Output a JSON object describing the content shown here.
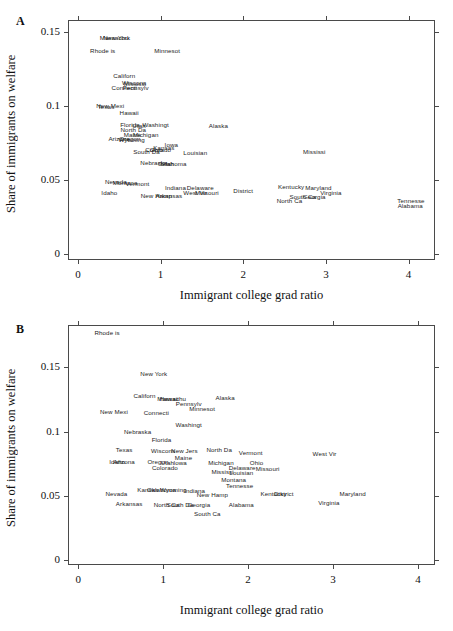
{
  "figure": {
    "axis_label_y": "Share of immigrants on welfare",
    "axis_label_x": "Immigrant college grad ratio",
    "panel_a_letter": "A",
    "panel_b_letter": "B"
  },
  "chart_data": [
    {
      "type": "scatter",
      "panel": "A",
      "title": "A",
      "xlabel": "Immigrant college grad ratio",
      "ylabel": "Share of immigrants on welfare",
      "xlim": [
        -0.12,
        4.32
      ],
      "ylim": [
        -0.004,
        0.158
      ],
      "xticks": [
        0,
        1,
        2,
        3,
        4
      ],
      "yticks": [
        0,
        0.05,
        0.1,
        0.15
      ],
      "xticklabels": [
        "0",
        "1",
        "2",
        "3",
        "4"
      ],
      "yticklabels": [
        "0",
        "0.05",
        "0.1",
        "0.15"
      ],
      "grid": false,
      "legend": "none",
      "marker": "text-label",
      "points": [
        {
          "label": "Massachu",
          "x": 0.44,
          "y": 0.1465
        },
        {
          "label": "New York",
          "x": 0.47,
          "y": 0.1465
        },
        {
          "label": "Rhode is",
          "x": 0.3,
          "y": 0.1375
        },
        {
          "label": "Minnesot",
          "x": 1.08,
          "y": 0.1375
        },
        {
          "label": "Californ",
          "x": 0.56,
          "y": 0.1212
        },
        {
          "label": "Wiscons",
          "x": 0.68,
          "y": 0.116
        },
        {
          "label": "Mississi",
          "x": 0.69,
          "y": 0.1158
        },
        {
          "label": "Connecti",
          "x": 0.56,
          "y": 0.113
        },
        {
          "label": "Pennsylv",
          "x": 0.7,
          "y": 0.1128
        },
        {
          "label": "New Mexi",
          "x": 0.39,
          "y": 0.1003
        },
        {
          "label": "Texas",
          "x": 0.34,
          "y": 0.1001
        },
        {
          "label": "Hawaii",
          "x": 0.62,
          "y": 0.096
        },
        {
          "label": "Florida",
          "x": 0.63,
          "y": 0.088
        },
        {
          "label": "Washingt",
          "x": 0.94,
          "y": 0.0878
        },
        {
          "label": "Utah",
          "x": 0.74,
          "y": 0.0872
        },
        {
          "label": "Alaska",
          "x": 1.7,
          "y": 0.0872
        },
        {
          "label": "North Da",
          "x": 0.67,
          "y": 0.0846
        },
        {
          "label": "Maine",
          "x": 0.66,
          "y": 0.0812
        },
        {
          "label": "Michigan",
          "x": 0.82,
          "y": 0.081
        },
        {
          "label": "Arizona",
          "x": 0.5,
          "y": 0.0786
        },
        {
          "label": "Oregon",
          "x": 0.63,
          "y": 0.0782
        },
        {
          "label": "Wyoming",
          "x": 0.65,
          "y": 0.078
        },
        {
          "label": "Iowa",
          "x": 1.13,
          "y": 0.074
        },
        {
          "label": "Kansas",
          "x": 1.04,
          "y": 0.0724
        },
        {
          "label": "Ohio",
          "x": 0.95,
          "y": 0.071
        },
        {
          "label": "Colorado",
          "x": 0.97,
          "y": 0.0706
        },
        {
          "label": "South Da",
          "x": 0.83,
          "y": 0.0694
        },
        {
          "label": "Louisian",
          "x": 1.42,
          "y": 0.069
        },
        {
          "label": "Mississi",
          "x": 2.86,
          "y": 0.0694
        },
        {
          "label": "Nebraska",
          "x": 0.92,
          "y": 0.062
        },
        {
          "label": "Utah",
          "x": 1.08,
          "y": 0.0618
        },
        {
          "label": "Oklahoma",
          "x": 1.14,
          "y": 0.0616
        },
        {
          "label": "Nevada",
          "x": 0.46,
          "y": 0.049
        },
        {
          "label": "Montana",
          "x": 0.57,
          "y": 0.0488
        },
        {
          "label": "Vermont",
          "x": 0.72,
          "y": 0.0478
        },
        {
          "label": "Kentucky",
          "x": 2.58,
          "y": 0.0462
        },
        {
          "label": "Maryland",
          "x": 2.91,
          "y": 0.0455
        },
        {
          "label": "Indiana",
          "x": 1.18,
          "y": 0.0452
        },
        {
          "label": "Delaware",
          "x": 1.48,
          "y": 0.0452
        },
        {
          "label": "District",
          "x": 2.0,
          "y": 0.043
        },
        {
          "label": "Virginia",
          "x": 3.06,
          "y": 0.042
        },
        {
          "label": "Idaho",
          "x": 0.38,
          "y": 0.042
        },
        {
          "label": "West Vir",
          "x": 1.42,
          "y": 0.0422
        },
        {
          "label": "Missouri",
          "x": 1.56,
          "y": 0.042
        },
        {
          "label": "New Hamp",
          "x": 0.95,
          "y": 0.04
        },
        {
          "label": "Arkansas",
          "x": 1.1,
          "y": 0.0402
        },
        {
          "label": "South Ca",
          "x": 2.72,
          "y": 0.0392
        },
        {
          "label": "Georgia",
          "x": 2.86,
          "y": 0.039
        },
        {
          "label": "North Ca",
          "x": 2.56,
          "y": 0.0368
        },
        {
          "label": "Tennesse",
          "x": 4.03,
          "y": 0.0368
        },
        {
          "label": "Alabama",
          "x": 4.02,
          "y": 0.033
        }
      ]
    },
    {
      "type": "scatter",
      "panel": "B",
      "title": "B",
      "xlabel": "Immigrant college grad ratio",
      "ylabel": "Share of immigrants on welfare",
      "xlim": [
        -0.12,
        4.2
      ],
      "ylim": [
        -0.004,
        0.183
      ],
      "xticks": [
        0,
        1,
        2,
        3,
        4
      ],
      "yticks": [
        0,
        0.05,
        0.1,
        0.15
      ],
      "xticklabels": [
        "0",
        "1",
        "2",
        "3",
        "4"
      ],
      "yticklabels": [
        "0",
        "0.05",
        "0.1",
        "0.15"
      ],
      "grid": false,
      "legend": "none",
      "marker": "text-label",
      "points": [
        {
          "label": "Rhode is",
          "x": 0.34,
          "y": 0.1775
        },
        {
          "label": "New York",
          "x": 0.89,
          "y": 0.1455
        },
        {
          "label": "Californ",
          "x": 0.78,
          "y": 0.1288
        },
        {
          "label": "Hawaii",
          "x": 1.07,
          "y": 0.1262
        },
        {
          "label": "Massachu",
          "x": 1.1,
          "y": 0.1262
        },
        {
          "label": "Alaska",
          "x": 1.73,
          "y": 0.1272
        },
        {
          "label": "Pennsylv",
          "x": 1.3,
          "y": 0.1222
        },
        {
          "label": "Minnesot",
          "x": 1.46,
          "y": 0.1182
        },
        {
          "label": "New Mexi",
          "x": 0.42,
          "y": 0.116
        },
        {
          "label": "Connecti",
          "x": 0.92,
          "y": 0.1152
        },
        {
          "label": "Washingt",
          "x": 1.3,
          "y": 0.1058
        },
        {
          "label": "Nebraska",
          "x": 0.7,
          "y": 0.1002
        },
        {
          "label": "Florida",
          "x": 0.98,
          "y": 0.0938
        },
        {
          "label": "Texas",
          "x": 0.54,
          "y": 0.086
        },
        {
          "label": "Wiscons",
          "x": 1.0,
          "y": 0.0858
        },
        {
          "label": "New Jers",
          "x": 1.25,
          "y": 0.0858
        },
        {
          "label": "North Da",
          "x": 1.66,
          "y": 0.086
        },
        {
          "label": "Vermont",
          "x": 2.03,
          "y": 0.084
        },
        {
          "label": "West Vir",
          "x": 2.9,
          "y": 0.0832
        },
        {
          "label": "Maine",
          "x": 1.24,
          "y": 0.0805
        },
        {
          "label": "Idaho",
          "x": 0.46,
          "y": 0.0772
        },
        {
          "label": "Arizona",
          "x": 0.54,
          "y": 0.0768
        },
        {
          "label": "Oregon",
          "x": 0.94,
          "y": 0.0768
        },
        {
          "label": "Utah",
          "x": 1.05,
          "y": 0.0766
        },
        {
          "label": "Iowa",
          "x": 1.2,
          "y": 0.076
        },
        {
          "label": "Michigan",
          "x": 1.68,
          "y": 0.0762
        },
        {
          "label": "Ohio",
          "x": 2.1,
          "y": 0.076
        },
        {
          "label": "Colorado",
          "x": 1.02,
          "y": 0.0722
        },
        {
          "label": "Missouri",
          "x": 2.23,
          "y": 0.0718
        },
        {
          "label": "Delaware",
          "x": 1.93,
          "y": 0.072
        },
        {
          "label": "Mississi",
          "x": 1.7,
          "y": 0.069
        },
        {
          "label": "Louisian",
          "x": 1.92,
          "y": 0.0688
        },
        {
          "label": "Montana",
          "x": 1.83,
          "y": 0.0632
        },
        {
          "label": "Kansas",
          "x": 0.82,
          "y": 0.0552
        },
        {
          "label": "Oklahoma",
          "x": 0.98,
          "y": 0.0552
        },
        {
          "label": "Wyoming",
          "x": 1.12,
          "y": 0.055
        },
        {
          "label": "Indiana",
          "x": 1.37,
          "y": 0.0548
        },
        {
          "label": "Tennesse",
          "x": 1.9,
          "y": 0.0582
        },
        {
          "label": "Nevada",
          "x": 0.45,
          "y": 0.0522
        },
        {
          "label": "New Hamp",
          "x": 1.58,
          "y": 0.0512
        },
        {
          "label": "Kentucky",
          "x": 2.3,
          "y": 0.0518
        },
        {
          "label": "District",
          "x": 2.42,
          "y": 0.0518
        },
        {
          "label": "Maryland",
          "x": 3.23,
          "y": 0.0518
        },
        {
          "label": "Virginia",
          "x": 2.95,
          "y": 0.0452
        },
        {
          "label": "Arkansas",
          "x": 0.6,
          "y": 0.044
        },
        {
          "label": "North Ca",
          "x": 1.04,
          "y": 0.0438
        },
        {
          "label": "South Da",
          "x": 1.2,
          "y": 0.0438
        },
        {
          "label": "Georgia",
          "x": 1.42,
          "y": 0.0432
        },
        {
          "label": "Alabama",
          "x": 1.92,
          "y": 0.0432
        },
        {
          "label": "South Ca",
          "x": 1.52,
          "y": 0.0368
        }
      ]
    }
  ]
}
